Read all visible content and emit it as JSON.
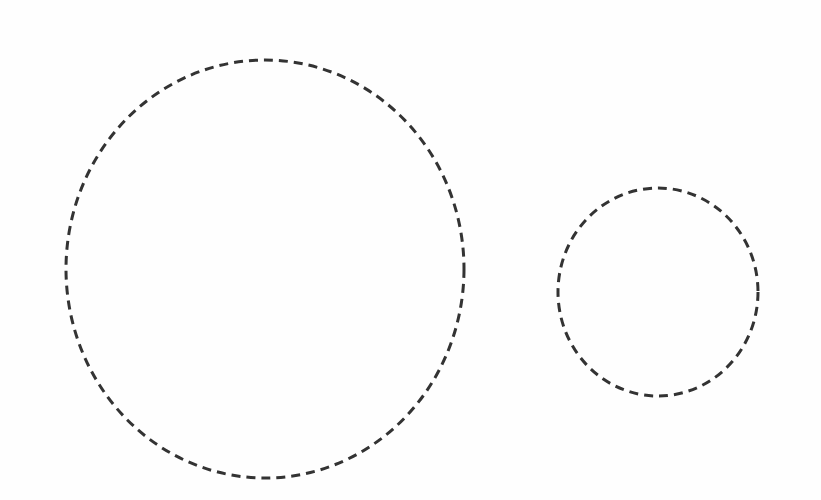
{
  "diagram": {
    "background": "#ffffff",
    "stroke_color": "#333333",
    "stroke_width": 3,
    "dash_pattern": "9 6",
    "shapes": [
      {
        "id": "large-circle",
        "type": "ellipse",
        "style": "dashed",
        "cx": 265,
        "cy": 269,
        "rx": 199,
        "ry": 209
      },
      {
        "id": "small-circle",
        "type": "ellipse",
        "style": "dashed",
        "cx": 658,
        "cy": 292,
        "rx": 100,
        "ry": 104
      }
    ]
  }
}
